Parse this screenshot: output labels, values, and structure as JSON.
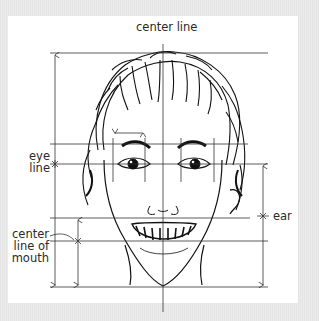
{
  "diagram": {
    "title_label": "center line",
    "labels": {
      "eye_line_1": "eye",
      "eye_line_2": "line",
      "mouth_1": "center",
      "mouth_2": "line of",
      "mouth_3": "mouth",
      "ear": "ear"
    },
    "colors": {
      "background": "#e8e8e8",
      "panel": "#ffffff",
      "lines": "#333333",
      "ink": "#111111"
    }
  }
}
